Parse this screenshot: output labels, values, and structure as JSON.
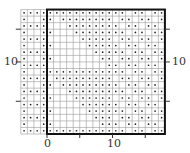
{
  "diagram": {
    "grid": {
      "origin_px": [
        47,
        134
      ],
      "cell_px": 6.55,
      "x_min": -4,
      "x_max": 18,
      "y_min": 0,
      "y_max": 19,
      "grid_color": "#9a9a9a",
      "dot_color": "#222222"
    },
    "box": {
      "x0": 0,
      "y0": 0,
      "x1": 18,
      "y1": 19,
      "color": "#111111"
    },
    "axis_labels": {
      "x_zero": "0",
      "x_ten": "10",
      "y_ten_left": "10",
      "y_ten_right": "10"
    },
    "ticks": {
      "x": [
        0,
        5,
        10,
        15
      ],
      "y": [
        5,
        11,
        16
      ]
    },
    "pattern": {
      "description": "Dots fill the left strip (x<0) in alternating rows and the boxed region except two lower-left triangular blank zones",
      "blank_triangles": [
        {
          "x0": 0,
          "y0": 0,
          "size": 9
        },
        {
          "x0": 0,
          "y0": 10,
          "size": 9
        }
      ]
    }
  }
}
